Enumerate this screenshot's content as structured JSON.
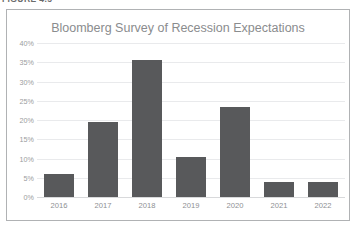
{
  "figure": {
    "caption": "FIGURE 4.5",
    "frame_border_color": "#b0b2b4"
  },
  "chart_data": {
    "type": "bar",
    "title": "Bloomberg Survey of Recession Expectations",
    "subtitle": "",
    "xlabel": "",
    "ylabel": "",
    "categories": [
      "2016",
      "2017",
      "2018",
      "2019",
      "2020",
      "2021",
      "2022"
    ],
    "values": [
      6.0,
      19.5,
      35.5,
      10.3,
      23.5,
      4.0,
      4.0
    ],
    "value_labels": [
      "6%",
      "19.5%",
      "35.5%",
      "10.3%",
      "23.5%",
      "4%",
      "4%"
    ],
    "ylim": [
      0,
      40
    ],
    "ytick_values": [
      40,
      35,
      30,
      25,
      20,
      15,
      10,
      5,
      0
    ],
    "ytick_labels": [
      "40%",
      "35%",
      "30%",
      "25%",
      "20%",
      "15%",
      "10%",
      "5%",
      "0%"
    ],
    "grid": true,
    "legend": false,
    "legend_position": "none",
    "bar_color": "#58595b",
    "gridline_color": "#e9eaec",
    "title_color": "#8a8c8e",
    "tick_label_color": "#9a9c9e"
  }
}
